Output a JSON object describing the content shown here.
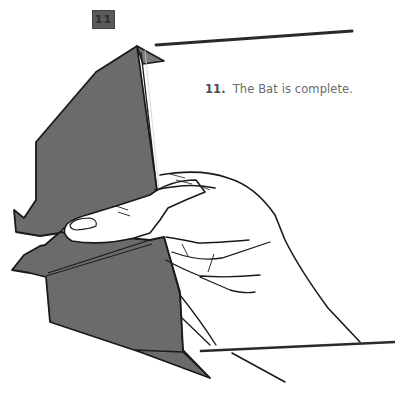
{
  "step": {
    "badge_label": "11",
    "number_label": "11.",
    "caption": "The Bat is complete."
  },
  "illustration": {
    "subject": "origami-bat-held-in-hand",
    "colors": {
      "paper": "#6b6b6b",
      "outline": "#1a1a1a",
      "background": "#ffffff",
      "badge": "#5a5a5a"
    }
  }
}
